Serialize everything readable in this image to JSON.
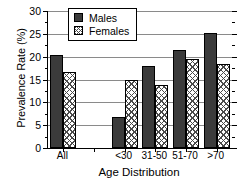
{
  "chart_data": {
    "type": "bar",
    "title": "",
    "xlabel": "Age Distribution",
    "ylabel": "Prevalence Rate (%)",
    "categories": [
      "All",
      "",
      "<30",
      "31-50",
      "51-70",
      ">70"
    ],
    "series": [
      {
        "name": "Males",
        "values": [
          20.4,
          null,
          6.7,
          18.0,
          21.4,
          25.1
        ]
      },
      {
        "name": "Females",
        "values": [
          16.6,
          null,
          15.0,
          13.9,
          19.4,
          18.4
        ]
      }
    ],
    "ylim": [
      0,
      30
    ],
    "yticks": [
      0,
      5,
      10,
      15,
      20,
      25,
      30
    ],
    "ytick_labels": [
      "0",
      "5",
      "10",
      "15",
      "20",
      "25",
      "30"
    ],
    "grid": true,
    "legend_position": "top-center"
  },
  "legend": {
    "items": [
      {
        "label": "Males",
        "swatch": "solid-dark-square"
      },
      {
        "label": "Females",
        "swatch": "cross-hatch-square"
      }
    ]
  }
}
